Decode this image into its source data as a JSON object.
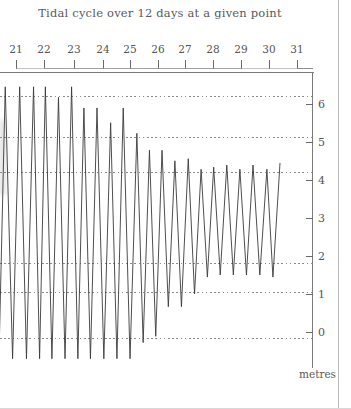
{
  "chart_data": {
    "type": "line",
    "title": "Tidal cycle over 12 days at a given point",
    "xlabel": "",
    "ylabel": "metres",
    "x_tick_labels": [
      "21",
      "22",
      "23",
      "24",
      "25",
      "26",
      "27",
      "28",
      "29",
      "30",
      "31"
    ],
    "y_tick_labels": [
      "0",
      "1",
      "2",
      "3",
      "4",
      "5",
      "6"
    ],
    "y_tick_values": [
      0,
      1,
      2,
      3,
      4,
      5,
      6
    ],
    "ylim": [
      -0.4,
      6.6
    ],
    "xlim": [
      20.4,
      32.3
    ],
    "grid": true,
    "gridline_values": [
      6.2,
      5.1,
      4.35,
      1.8,
      1.05,
      -0.15
    ],
    "legend": "none",
    "series": [
      {
        "name": "Tide height",
        "note": "Alternating high-water (peak) and low-water (trough) extremes in metres, sampled at successive tidal half-cycles.",
        "peaks_m": [
          6.25,
          6.25,
          6.25,
          6.25,
          6.0,
          6.25,
          5.75,
          5.75,
          5.4,
          5.75,
          5.15,
          4.75,
          4.75,
          4.5,
          4.55,
          4.3,
          4.35,
          4.4,
          4.3,
          4.4,
          4.3,
          4.45
        ],
        "troughs_m": [
          -0.18,
          -0.18,
          -0.18,
          -0.18,
          -0.18,
          -0.18,
          -0.18,
          -0.18,
          -0.18,
          -0.18,
          -0.18,
          0.2,
          0.35,
          1.05,
          1.05,
          1.35,
          1.75,
          1.8,
          1.8,
          1.8,
          1.8,
          1.75
        ],
        "x_peaks_day": [
          20.6,
          21.15,
          21.68,
          22.13,
          22.63,
          23.13,
          23.6,
          24.1,
          24.62,
          25.1,
          25.62,
          26.1,
          26.58,
          27.07,
          27.58,
          28.07,
          28.55,
          29.05,
          29.55,
          30.05,
          30.58,
          31.08
        ],
        "x_troughs_day": [
          20.36,
          20.88,
          21.41,
          21.91,
          22.38,
          22.88,
          23.37,
          23.85,
          24.36,
          24.86,
          25.36,
          25.86,
          26.34,
          26.82,
          27.32,
          27.82,
          28.31,
          28.8,
          29.3,
          29.8,
          30.31,
          30.81,
          31.31
        ]
      }
    ]
  },
  "chart": {
    "title": "Tidal cycle over 12 days at a given point",
    "y_axis_caption": "metres",
    "days": [
      {
        "label": "21",
        "x": 16
      },
      {
        "label": "22",
        "x": 44
      },
      {
        "label": "23",
        "x": 74
      },
      {
        "label": "24",
        "x": 103
      },
      {
        "label": "25",
        "x": 130
      },
      {
        "label": "26",
        "x": 158
      },
      {
        "label": "27",
        "x": 185
      },
      {
        "label": "28",
        "x": 213
      },
      {
        "label": "29",
        "x": 241
      },
      {
        "label": "30",
        "x": 269
      },
      {
        "label": "31",
        "x": 297
      }
    ],
    "y_labels": [
      {
        "label": "6",
        "y": 104
      },
      {
        "label": "5",
        "y": 142
      },
      {
        "label": "4",
        "y": 180
      },
      {
        "label": "3",
        "y": 218
      },
      {
        "label": "2",
        "y": 256
      },
      {
        "label": "1",
        "y": 294
      },
      {
        "label": "0",
        "y": 332
      }
    ],
    "gridlines": [
      {
        "y": 96,
        "width": 312
      },
      {
        "y": 137,
        "width": 312
      },
      {
        "y": 172,
        "width": 312
      },
      {
        "y": 263,
        "width": 312
      },
      {
        "y": 292,
        "width": 312
      },
      {
        "y": 338,
        "width": 312
      }
    ]
  }
}
